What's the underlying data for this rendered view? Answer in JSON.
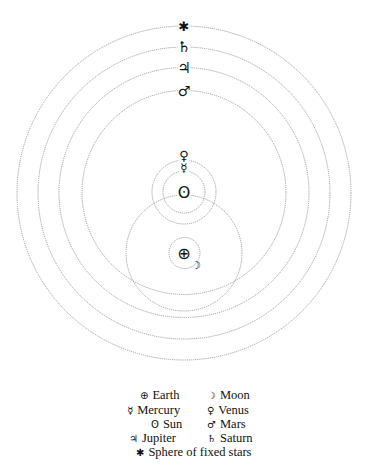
{
  "diagram": {
    "center_earth": {
      "x": 184,
      "y": 253
    },
    "center_sun": {
      "x": 184,
      "y": 192
    },
    "orbits": [
      {
        "name": "sphere-of-fixed-stars",
        "cx": 184,
        "cy": 193,
        "r": 167
      },
      {
        "name": "saturn-orbit",
        "cx": 184,
        "cy": 193,
        "r": 146
      },
      {
        "name": "jupiter-orbit",
        "cx": 184,
        "cy": 192.5,
        "r": 125
      },
      {
        "name": "mars-orbit",
        "cx": 184,
        "cy": 192.5,
        "r": 102
      },
      {
        "name": "sun-orbit",
        "cx": 184,
        "cy": 253,
        "r": 58
      },
      {
        "name": "venus-orbit",
        "cx": 184,
        "cy": 192,
        "r": 32
      },
      {
        "name": "mercury-orbit",
        "cx": 184,
        "cy": 192,
        "r": 21
      },
      {
        "name": "moon-orbit",
        "cx": 184.5,
        "cy": 253,
        "r": 15.5
      }
    ],
    "bodies": [
      {
        "name": "fixed-stars",
        "symbol": "✱",
        "x": 184,
        "y": 26,
        "size": 13
      },
      {
        "name": "saturn",
        "symbol": "♄",
        "x": 184,
        "y": 47,
        "size": 15
      },
      {
        "name": "jupiter",
        "symbol": "♃",
        "x": 184,
        "y": 68,
        "size": 15
      },
      {
        "name": "mars",
        "symbol": "♂",
        "x": 184,
        "y": 91,
        "size": 14
      },
      {
        "name": "venus",
        "symbol": "♀",
        "x": 184,
        "y": 155,
        "size": 13
      },
      {
        "name": "mercury",
        "symbol": "☿",
        "x": 184,
        "y": 168,
        "size": 12
      },
      {
        "name": "sun",
        "symbol": "ʘ",
        "x": 184,
        "y": 192,
        "size": 16
      },
      {
        "name": "earth",
        "symbol": "⊕",
        "x": 184,
        "y": 253,
        "size": 16
      },
      {
        "name": "moon",
        "symbol": "☽",
        "x": 196,
        "y": 265,
        "size": 11
      }
    ]
  },
  "legend": {
    "rows": [
      {
        "left": {
          "symbol": "⊕",
          "label": "Earth"
        },
        "right": {
          "symbol": "☽",
          "label": "Moon"
        }
      },
      {
        "left": {
          "symbol": "☿",
          "label": "Mercury"
        },
        "right": {
          "symbol": "♀",
          "label": "Venus"
        }
      },
      {
        "left": {
          "symbol": "ʘ",
          "label": "Sun"
        },
        "right": {
          "symbol": "♂",
          "label": "Mars"
        }
      },
      {
        "left": {
          "symbol": "♃",
          "label": "Jupiter"
        },
        "right": {
          "symbol": "♄",
          "label": "Saturn"
        }
      }
    ],
    "footer": {
      "symbol": "✱",
      "label": "Sphere of fixed stars"
    }
  }
}
